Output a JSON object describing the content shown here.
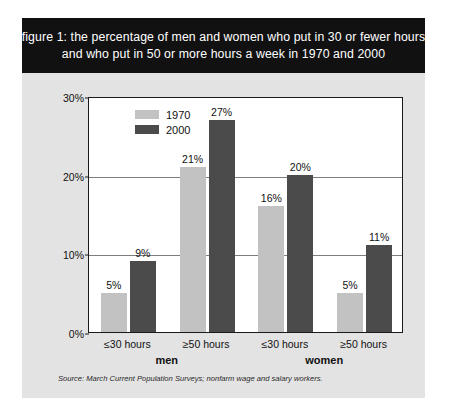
{
  "title": {
    "line1": "figure 1: the percentage of men and women who put in 30 or fewer hours",
    "line2": "and who put in 50 or more hours a week in 1970 and 2000"
  },
  "source_note": "Source: March Current Population Surveys; nonfarm wage and salary workers.",
  "colors": {
    "banner_background": "#111111",
    "banner_text": "#ffffff",
    "panel_background": "#e3e3e3",
    "plot_background": "#ffffff",
    "series_1970": "#c2c2c2",
    "series_2000": "#4b4b4b",
    "gridline": "#7d7d7d",
    "axis": "#1a1a1a"
  },
  "chart_data": {
    "type": "bar",
    "title": "figure 1: the percentage of men and women who put in 30 or fewer hours and who put in 50 or more hours a week in 1970 and 2000",
    "xlabel": "",
    "ylabel": "percentage of all workers",
    "ylim": [
      0,
      30
    ],
    "yticks": [
      0,
      10,
      20,
      30
    ],
    "ytick_labels": [
      "0%",
      "10%",
      "20%",
      "30%"
    ],
    "grid": true,
    "legend_position": "top-left inside plot",
    "categories": [
      "≤30 hours",
      "≥50 hours",
      "≤30 hours",
      "≥50 hours"
    ],
    "groups": [
      {
        "label": "men",
        "categories": [
          "≤30 hours",
          "≥50 hours"
        ]
      },
      {
        "label": "women",
        "categories": [
          "≤30 hours",
          "≥50 hours"
        ]
      }
    ],
    "series": [
      {
        "name": "1970",
        "color": "#c2c2c2",
        "values": [
          5,
          21,
          16,
          5
        ],
        "value_labels": [
          "5%",
          "21%",
          "16%",
          "5%"
        ]
      },
      {
        "name": "2000",
        "color": "#4b4b4b",
        "values": [
          9,
          27,
          20,
          11
        ],
        "value_labels": [
          "9%",
          "27%",
          "20%",
          "11%"
        ]
      }
    ],
    "bars": [
      {
        "group": "men",
        "category": "≤30 hours",
        "series": "1970",
        "value": 5,
        "label": "5%"
      },
      {
        "group": "men",
        "category": "≤30 hours",
        "series": "2000",
        "value": 9,
        "label": "9%"
      },
      {
        "group": "men",
        "category": "≥50 hours",
        "series": "1970",
        "value": 21,
        "label": "21%"
      },
      {
        "group": "men",
        "category": "≥50 hours",
        "series": "2000",
        "value": 27,
        "label": "27%"
      },
      {
        "group": "women",
        "category": "≤30 hours",
        "series": "1970",
        "value": 16,
        "label": "16%"
      },
      {
        "group": "women",
        "category": "≤30 hours",
        "series": "2000",
        "value": 20,
        "label": "20%"
      },
      {
        "group": "women",
        "category": "≥50 hours",
        "series": "1970",
        "value": 5,
        "label": "5%"
      },
      {
        "group": "women",
        "category": "≥50 hours",
        "series": "2000",
        "value": 11,
        "label": "11%"
      }
    ]
  }
}
